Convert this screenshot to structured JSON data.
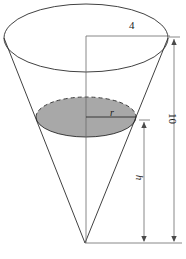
{
  "figure": {
    "type": "geometry-diagram",
    "background_color": "#ffffff",
    "stroke_color": "#2b2b2b",
    "dimension_line_color": "#6b6b6b",
    "shaded_fill_color": "#a8a8a8",
    "labels": {
      "top_radius": "4",
      "inner_radius": "r",
      "inner_height": "h",
      "total_height": "10"
    },
    "geometry": {
      "top_ellipse": {
        "center_x": 86,
        "center_y": 38,
        "radius_x": 82,
        "radius_y": 34
      },
      "inner_ellipse": {
        "center_x": 86,
        "center_y": 117,
        "radius_x": 50,
        "radius_y": 20,
        "shaded": true,
        "top_arc_style": "dashed",
        "bottom_arc_style": "solid"
      },
      "apex": {
        "x": 85,
        "y": 243
      },
      "axis": {
        "x": 86,
        "top_y": 36,
        "bottom_y": 243
      },
      "dimension_4": {
        "from_x": 86,
        "to_x": 170,
        "y": 36
      },
      "dimension_h": {
        "x": 144,
        "top_y": 120,
        "bottom_y": 243
      },
      "dimension_10": {
        "x": 174,
        "top_y": 37,
        "bottom_y": 243
      },
      "baseline": {
        "from_x": 85,
        "to_x": 182,
        "y": 243
      }
    }
  }
}
